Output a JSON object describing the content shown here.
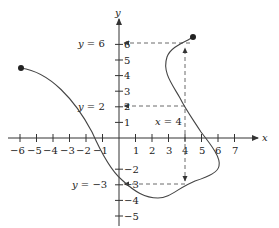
{
  "chart_data": {
    "type": "line",
    "title": "",
    "xlabel": "x",
    "ylabel": "y",
    "xlim": [
      -6,
      7
    ],
    "ylim": [
      -5,
      6
    ],
    "grid": false,
    "x_tick_labels": [
      "−6",
      "−5",
      "−4",
      "−3",
      "−2",
      "−1",
      "1",
      "2",
      "3",
      "4",
      "5",
      "6",
      "7"
    ],
    "y_tick_labels": [
      "6",
      "5",
      "4",
      "3",
      "2",
      "1",
      "−2",
      "−3",
      "−4",
      "−5"
    ],
    "series": [
      {
        "name": "curve",
        "points": [
          {
            "x": -6,
            "y": 4.5
          },
          {
            "x": -4,
            "y": 3.8
          },
          {
            "x": -2,
            "y": 1.6
          },
          {
            "x": -1.7,
            "y": 0
          },
          {
            "x": 0,
            "y": -2.7
          },
          {
            "x": 1,
            "y": -3.5
          },
          {
            "x": 2.5,
            "y": -4
          },
          {
            "x": 4,
            "y": -3
          },
          {
            "x": 6,
            "y": -1.8
          },
          {
            "x": 5.5,
            "y": -0.5
          },
          {
            "x": 5,
            "y": 0
          },
          {
            "x": 4,
            "y": 2
          },
          {
            "x": 2.8,
            "y": 4.5
          },
          {
            "x": 3,
            "y": 5.5
          },
          {
            "x": 4.5,
            "y": 6.5
          }
        ],
        "endpoints": [
          {
            "x": -6,
            "y": 4.5
          },
          {
            "x": 4.5,
            "y": 6.5
          }
        ]
      }
    ],
    "annotations": [
      {
        "text": "y = 6",
        "type": "horizontal-dashed",
        "value": 6
      },
      {
        "text": "y = 2",
        "type": "horizontal-dashed",
        "value": 2
      },
      {
        "text": "y = −3",
        "type": "horizontal-dashed",
        "value": -3
      },
      {
        "text": "x = 4",
        "type": "vertical-dashed",
        "value": 4
      }
    ]
  },
  "labels": {
    "x_axis": "x",
    "y_axis": "y",
    "y6": "y = 6",
    "y2": "y = 2",
    "ym3": "y = −3",
    "x4": "x = 4"
  }
}
